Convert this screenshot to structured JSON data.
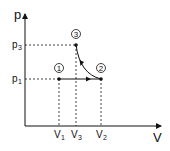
{
  "diagram": {
    "type": "pV-diagram",
    "axes": {
      "y_label": "p",
      "x_label": "V"
    },
    "y_ticks": [
      {
        "base": "p",
        "sub": "3"
      },
      {
        "base": "p",
        "sub": "1"
      }
    ],
    "x_ticks": [
      {
        "base": "V",
        "sub": "1"
      },
      {
        "base": "V",
        "sub": "3"
      },
      {
        "base": "V",
        "sub": "2"
      }
    ],
    "points": [
      {
        "id": "1",
        "label": "1",
        "coords": "(V1, p1)"
      },
      {
        "id": "2",
        "label": "2",
        "coords": "(V2, p1)"
      },
      {
        "id": "3",
        "label": "3",
        "coords": "(V3, p3)"
      }
    ],
    "processes": [
      {
        "from": "1",
        "to": "2",
        "kind": "isobaric line, arrow pointing right"
      },
      {
        "from": "2",
        "to": "3",
        "kind": "curve, arrow pointing toward 3"
      }
    ],
    "colors": {
      "ink": "#111111",
      "background": "#ffffff"
    }
  }
}
